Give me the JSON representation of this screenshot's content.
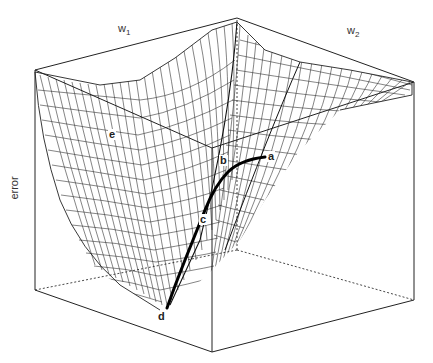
{
  "figure": {
    "type": "3d-error-surface",
    "axes": {
      "x_label": "w",
      "x_sub": "1",
      "y_label": "w",
      "y_sub": "2",
      "z_label": "error"
    },
    "points": [
      {
        "id": "a",
        "label": "a"
      },
      {
        "id": "b",
        "label": "b"
      },
      {
        "id": "c",
        "label": "c"
      },
      {
        "id": "d",
        "label": "d"
      },
      {
        "id": "e",
        "label": "e"
      }
    ],
    "path": "a → b → c → d (gradient descent trajectory)",
    "colors": {
      "line": "#222222",
      "path": "#000000",
      "background": "#ffffff"
    }
  }
}
